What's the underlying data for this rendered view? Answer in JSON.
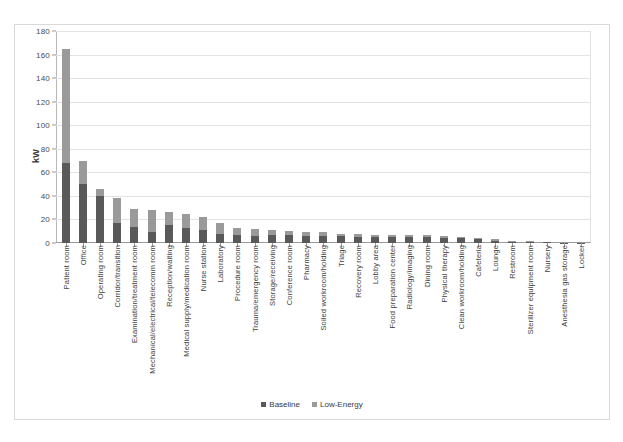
{
  "chart_data": {
    "type": "bar",
    "subtype": "stacked-column",
    "title": "",
    "xlabel": "",
    "ylabel": "kW",
    "ylim": [
      0,
      180
    ],
    "yticks": [
      0,
      20,
      40,
      60,
      80,
      100,
      120,
      140,
      160,
      180
    ],
    "grid": true,
    "legend_position": "bottom",
    "categories": [
      "Patient room",
      "Office",
      "Operating room",
      "Corridor/transition",
      "Examination/treatment room",
      "Mechanical/electrical/telecomm room",
      "Reception/waiting",
      "Medical supply/medication room",
      "Nurse station",
      "Laboratory",
      "Procedure room",
      "Trauma/emergency room",
      "Storage/receiving",
      "Conference room",
      "Pharmacy",
      "Soiled workroom/holding",
      "Triage",
      "Recovery room",
      "Lobby area",
      "Food preparation center",
      "Radiology/imaging",
      "Dining room",
      "Physical therapy",
      "Clean workroom/holding",
      "Cafeteria",
      "Lounge",
      "Restroom",
      "Sterilizer equipment room",
      "Nursery",
      "Anesthesia gas storage",
      "Locker"
    ],
    "series": [
      {
        "name": "Baseline",
        "color": "#595959",
        "values": [
          68,
          50,
          40,
          17,
          14,
          9,
          15,
          13,
          11,
          8,
          7,
          6,
          7,
          7,
          6,
          6,
          6,
          5,
          5,
          5,
          5,
          5,
          4,
          4,
          3,
          2,
          1,
          1,
          0.6,
          0.4,
          0.3
        ]
      },
      {
        "name": "Low-Energy",
        "color": "#9a9a9a",
        "values": [
          97,
          20,
          6,
          21,
          15,
          19,
          11,
          12,
          11,
          9,
          6,
          6,
          4,
          3,
          3,
          3,
          2,
          3,
          2,
          2,
          2,
          2,
          2,
          1,
          1,
          1,
          0.6,
          0.5,
          0.3,
          0.3,
          0.2
        ]
      }
    ],
    "totals": [
      165,
      70,
      46,
      38,
      29,
      28,
      26,
      25,
      23,
      17,
      13,
      12,
      11,
      10,
      9,
      9,
      8,
      8,
      7,
      7,
      7,
      7,
      6,
      5,
      4,
      3,
      1.6,
      1.5,
      0.9,
      0.7,
      0.5
    ]
  },
  "legend": {
    "items": [
      {
        "label": "Baseline",
        "color": "#595959"
      },
      {
        "label": "Low-Energy",
        "color": "#9a9a9a"
      }
    ]
  },
  "axis": {
    "y_title": "kW"
  }
}
